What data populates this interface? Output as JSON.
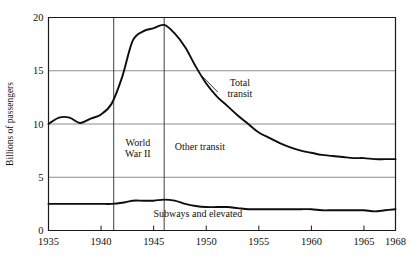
{
  "chart_data": {
    "type": "line",
    "title": "",
    "xlabel": "",
    "ylabel": "Billions of passengers",
    "xlim": [
      1935,
      1968
    ],
    "ylim": [
      0,
      20
    ],
    "grid": true,
    "legend_position": "inline-annotations",
    "x_ticks": [
      {
        "value": 1935,
        "label": "1935"
      },
      {
        "value": 1940,
        "label": "1940"
      },
      {
        "value": 1945,
        "label": "1945"
      },
      {
        "value": 1950,
        "label": "1950"
      },
      {
        "value": 1955,
        "label": "1955"
      },
      {
        "value": 1960,
        "label": "1960"
      },
      {
        "value": 1965,
        "label": "1965"
      },
      {
        "value": 1968,
        "label": "1968"
      }
    ],
    "y_ticks": [
      {
        "value": 0,
        "label": "0"
      },
      {
        "value": 5,
        "label": "5"
      },
      {
        "value": 10,
        "label": "10"
      },
      {
        "value": 15,
        "label": "15"
      },
      {
        "value": 20,
        "label": "20"
      }
    ],
    "series": [
      {
        "name": "Total transit",
        "x": [
          1935,
          1936,
          1937,
          1938,
          1939,
          1940,
          1941,
          1942,
          1943,
          1944,
          1945,
          1946,
          1947,
          1948,
          1949,
          1950,
          1951,
          1952,
          1953,
          1954,
          1955,
          1956,
          1957,
          1958,
          1959,
          1960,
          1961,
          1962,
          1963,
          1964,
          1965,
          1966,
          1967,
          1968
        ],
        "values": [
          10.0,
          10.6,
          10.6,
          10.1,
          10.5,
          10.9,
          11.9,
          14.4,
          17.8,
          18.7,
          19.0,
          19.3,
          18.5,
          17.2,
          15.4,
          13.8,
          12.6,
          11.7,
          10.8,
          10.0,
          9.2,
          8.7,
          8.2,
          7.8,
          7.5,
          7.3,
          7.1,
          7.0,
          6.9,
          6.8,
          6.8,
          6.7,
          6.7,
          6.7
        ]
      },
      {
        "name": "Subways and elevated",
        "x": [
          1935,
          1936,
          1937,
          1938,
          1939,
          1940,
          1941,
          1942,
          1943,
          1944,
          1945,
          1946,
          1947,
          1948,
          1949,
          1950,
          1951,
          1952,
          1953,
          1954,
          1955,
          1956,
          1957,
          1958,
          1959,
          1960,
          1961,
          1962,
          1963,
          1964,
          1965,
          1966,
          1967,
          1968
        ],
        "values": [
          2.5,
          2.5,
          2.5,
          2.5,
          2.5,
          2.5,
          2.5,
          2.6,
          2.8,
          2.8,
          2.8,
          2.9,
          2.8,
          2.5,
          2.3,
          2.2,
          2.2,
          2.2,
          2.1,
          2.0,
          2.0,
          2.0,
          2.0,
          2.0,
          2.0,
          2.0,
          1.9,
          1.9,
          1.9,
          1.9,
          1.9,
          1.8,
          1.9,
          2.0
        ]
      }
    ],
    "event_markers": [
      {
        "label": "World War II",
        "start": 1941.2,
        "end": 1946.0
      }
    ],
    "annotations": [
      {
        "name": "world-war-2",
        "text_line1": "World",
        "text_line2": "War II",
        "x": 1943.5,
        "y": 7.5
      },
      {
        "name": "other-transit",
        "text": "Other transit",
        "x": 1949.4,
        "y": 7.6
      },
      {
        "name": "total-transit",
        "text_line1": "Total",
        "text_line2": "transit",
        "x": 1953.2,
        "y": 13.2
      },
      {
        "name": "subways-and-elevated",
        "text": "Subways and elevated",
        "x": 1949.2,
        "y": 1.3
      }
    ]
  },
  "axis": {
    "y_title": "Billions of passengers"
  },
  "colors": {
    "line": "#0d0d0d",
    "grid": "#6f6f6f",
    "frame": "#1a1a1a",
    "background": "#ffffff",
    "text": "#111111"
  }
}
